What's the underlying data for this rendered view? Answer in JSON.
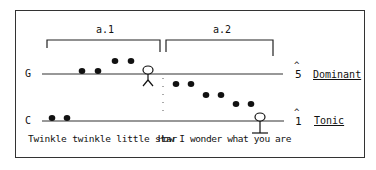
{
  "diagram": {
    "sections": [
      {
        "label": "a.1"
      },
      {
        "label": "a.2"
      }
    ],
    "pitch_lines": [
      {
        "note": "G",
        "degree": "5",
        "function": "Dominant"
      },
      {
        "note": "C",
        "degree": "1",
        "function": "Tonic"
      }
    ],
    "lyrics": {
      "phrase1": "Twinkle twinkle little star",
      "phrase2": "How I wonder what you are"
    },
    "caret": "^"
  }
}
